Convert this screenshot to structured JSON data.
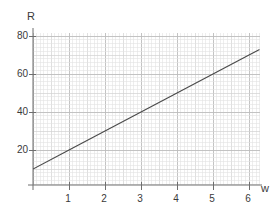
{
  "chart_data": {
    "type": "line",
    "title": "",
    "subtitle": "",
    "xlabel": "w",
    "ylabel": "R",
    "xlim": [
      0,
      6.28
    ],
    "ylim": [
      0,
      84
    ],
    "grid": true,
    "grid_style": "graph-paper",
    "legend": "none",
    "xticks": [
      1,
      2,
      3,
      4,
      5,
      6
    ],
    "xtick_labels": [
      "1",
      "2",
      "3",
      "4",
      "5",
      "6"
    ],
    "yticks": [
      20,
      40,
      60,
      80
    ],
    "ytick_labels": [
      "20",
      "40",
      "60",
      "80"
    ],
    "series": [
      {
        "name": "R vs w",
        "x": [
          0,
          1,
          2,
          3,
          4,
          5,
          6,
          6.28
        ],
        "values": [
          10,
          20,
          30,
          40,
          50,
          60,
          70,
          72.8
        ],
        "equation": "R = 10w + 10",
        "intercept": 10,
        "slope": 10,
        "color": "#4a4a4a"
      }
    ],
    "colors": {
      "line": "#4a4a4a",
      "axis": "#6e6e6e",
      "grid_minor": "#e3e3e3",
      "grid_mid": "#d2d2d2",
      "grid_major": "#bdbdbd",
      "text": "#3a3a3a",
      "background": "#ffffff"
    }
  },
  "labels": {
    "y_axis_name": "R",
    "x_axis_name": "w",
    "y_ticks": [
      "80",
      "60",
      "40",
      "20"
    ],
    "x_ticks": [
      "1",
      "2",
      "3",
      "4",
      "5",
      "6"
    ]
  }
}
